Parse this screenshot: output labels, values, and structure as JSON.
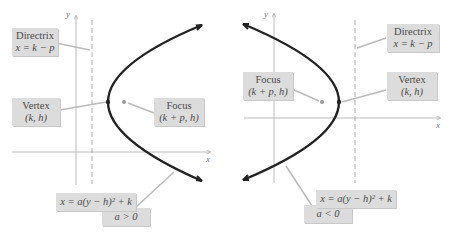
{
  "figure": "Horizontal parabolas with vertex (k, h)",
  "left_panel": {
    "case": "opens right",
    "axes": {
      "x_label": "x",
      "y_label": "y"
    },
    "directrix": {
      "title": "Directrix",
      "equation": "x = k − p"
    },
    "vertex": {
      "title": "Vertex",
      "coords": "(k, h)"
    },
    "focus": {
      "title": "Focus",
      "coords": "(k + p, h)"
    },
    "equation": "x = a(y − h)² + k",
    "condition": "a > 0"
  },
  "right_panel": {
    "case": "opens left",
    "axes": {
      "x_label": "x",
      "y_label": "y"
    },
    "directrix": {
      "title": "Directrix",
      "equation": "x = k − p"
    },
    "vertex": {
      "title": "Vertex",
      "coords": "(k, h)"
    },
    "focus": {
      "title": "Focus",
      "coords": "(k + p, h)"
    },
    "equation": "x = a(y − h)² + k",
    "condition": "a < 0"
  },
  "colors": {
    "curve": "#222222",
    "axis": "#aaaaaa",
    "label_bg": "#dcdcdc",
    "leader": "#bbbbbb"
  }
}
